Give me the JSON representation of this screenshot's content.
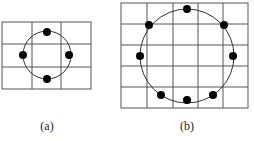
{
  "figures": [
    {
      "id": "a",
      "label": "(a)",
      "grid_cols": 3,
      "grid_rows": 3,
      "dots": 4
    },
    {
      "id": "b",
      "label": "(b)",
      "grid_cols": 5,
      "grid_rows": 5,
      "dots": 8
    }
  ],
  "colors": {
    "grid": "#555555",
    "circle": "#333333",
    "dot": "#000000"
  }
}
